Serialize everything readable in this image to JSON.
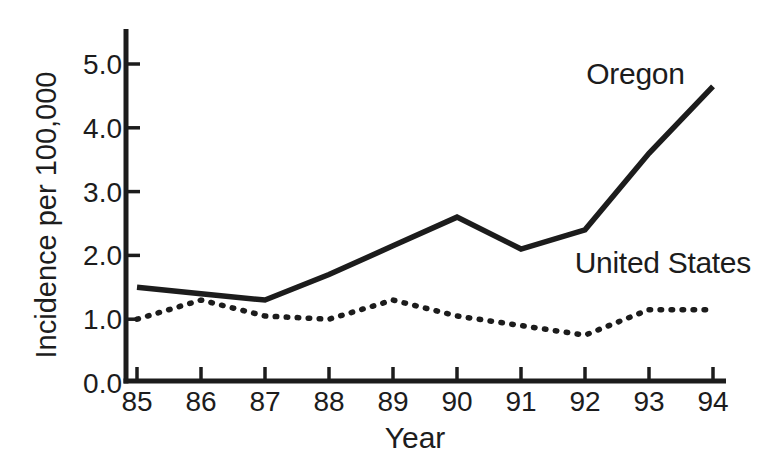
{
  "page": {
    "background_color": "#ffffff",
    "ink_color": "#1c1c1c"
  },
  "chart_data": {
    "type": "line",
    "title": "",
    "xlabel": "Year",
    "ylabel": "Incidence per 100,000",
    "categories": [
      "85",
      "86",
      "87",
      "88",
      "89",
      "90",
      "91",
      "92",
      "93",
      "94"
    ],
    "y_tick_labels": [
      "0.0",
      "1.0",
      "2.0",
      "3.0",
      "4.0",
      "5.0"
    ],
    "ylim": [
      0,
      5.55
    ],
    "grid": false,
    "legend_position": "inline-annotations",
    "series": [
      {
        "name": "Oregon",
        "line_style": "solid",
        "values": [
          1.5,
          1.4,
          1.3,
          1.7,
          2.15,
          2.6,
          2.1,
          2.4,
          3.6,
          4.65
        ],
        "label_pos": {
          "x_index": 7.02,
          "y_value": 4.69
        }
      },
      {
        "name": "United States",
        "line_style": "dotted",
        "values": [
          1.0,
          1.3,
          1.05,
          1.0,
          1.3,
          1.05,
          0.9,
          0.75,
          1.15,
          1.15
        ],
        "label_pos": {
          "x_index": 6.84,
          "y_value": 1.72
        }
      }
    ]
  }
}
